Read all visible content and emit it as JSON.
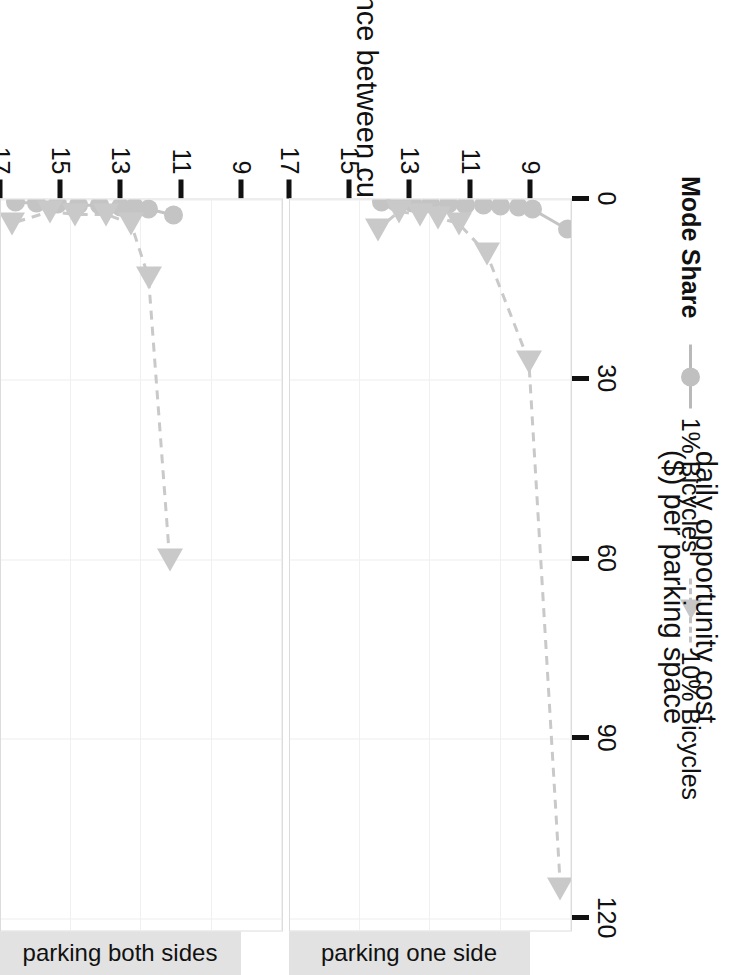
{
  "chart_data": {
    "type": "line",
    "title": "",
    "xlabel": "daily opportunity cost ($) per parking space",
    "xlabel_line1": "daily opportunity cost",
    "xlabel_line2": "($) per parking space",
    "ylabel": "distance between curbs (m)",
    "xlim": [
      0,
      122
    ],
    "ylim": [
      9,
      17
    ],
    "xticks": [
      0,
      30,
      60,
      90,
      120
    ],
    "xtick_labels": [
      "0",
      "30",
      "60",
      "90",
      "120"
    ],
    "yticks": [
      9,
      11,
      13,
      15,
      17
    ],
    "ytick_labels": [
      "9",
      "11",
      "13",
      "15",
      "17"
    ],
    "grid": true,
    "legend_position": "bottom",
    "legend_title": "Mode Share",
    "series_names": [
      "1% Bicycles",
      "10% Bicycles"
    ],
    "colors": {
      "series_1pct": "#c4c4c4",
      "series_10pct": "#c9c9c9",
      "strip_background": "#e2e2e2",
      "grid": "#ededed",
      "axis": "#111111",
      "panel_background": "#ffffff"
    },
    "facets": [
      {
        "label": "parking one side",
        "series": [
          {
            "name": "1% Bicycles",
            "marker": "circle",
            "linestyle": "solid",
            "points": [
              {
                "y": 9.1,
                "x": 5.0
              },
              {
                "y": 10.1,
                "x": 1.6
              },
              {
                "y": 10.5,
                "x": 1.3
              },
              {
                "y": 11.0,
                "x": 1.1
              },
              {
                "y": 11.5,
                "x": 1.0
              },
              {
                "y": 12.0,
                "x": 0.9
              },
              {
                "y": 12.5,
                "x": 0.8
              },
              {
                "y": 13.0,
                "x": 0.7
              },
              {
                "y": 13.5,
                "x": 0.6
              },
              {
                "y": 14.0,
                "x": 0.5
              },
              {
                "y": 14.4,
                "x": 0.4
              }
            ]
          },
          {
            "name": "10% Bicycles",
            "marker": "triangle",
            "linestyle": "dashed",
            "points": [
              {
                "y": 9.3,
                "x": 115.0
              },
              {
                "y": 10.2,
                "x": 27.0
              },
              {
                "y": 11.4,
                "x": 9.0
              },
              {
                "y": 12.2,
                "x": 4.0
              },
              {
                "y": 12.8,
                "x": 3.0
              },
              {
                "y": 13.3,
                "x": 2.5
              },
              {
                "y": 13.9,
                "x": 2.0
              },
              {
                "y": 14.5,
                "x": 5.0
              }
            ]
          }
        ]
      },
      {
        "label": "parking both sides",
        "series": [
          {
            "name": "1% Bicycles",
            "marker": "circle",
            "linestyle": "solid",
            "points": [
              {
                "y": 12.1,
                "x": 2.6
              },
              {
                "y": 12.8,
                "x": 1.6
              },
              {
                "y": 13.2,
                "x": 1.3
              },
              {
                "y": 13.6,
                "x": 1.2
              },
              {
                "y": 14.2,
                "x": 1.0
              },
              {
                "y": 14.8,
                "x": 0.9
              },
              {
                "y": 15.4,
                "x": 0.7
              },
              {
                "y": 16.0,
                "x": 0.6
              },
              {
                "y": 16.6,
                "x": 0.5
              }
            ]
          },
          {
            "name": "10% Bicycles",
            "marker": "triangle",
            "linestyle": "dashed",
            "points": [
              {
                "y": 12.2,
                "x": 60.0
              },
              {
                "y": 12.8,
                "x": 13.0
              },
              {
                "y": 13.3,
                "x": 4.0
              },
              {
                "y": 14.0,
                "x": 2.5
              },
              {
                "y": 14.9,
                "x": 2.5
              },
              {
                "y": 15.6,
                "x": 2.0
              },
              {
                "y": 16.7,
                "x": 4.0
              }
            ]
          }
        ]
      }
    ]
  },
  "legend": {
    "title": "Mode Share",
    "entries": [
      {
        "label": "1% Bicycles",
        "marker": "circle",
        "linestyle": "solid"
      },
      {
        "label": "10% Bicycles",
        "marker": "triangle",
        "linestyle": "dashed"
      }
    ]
  },
  "axes": {
    "x_title_line1": "daily opportunity cost",
    "x_title_line2": "($) per parking space",
    "y_title": "distance between curbs (m)"
  }
}
